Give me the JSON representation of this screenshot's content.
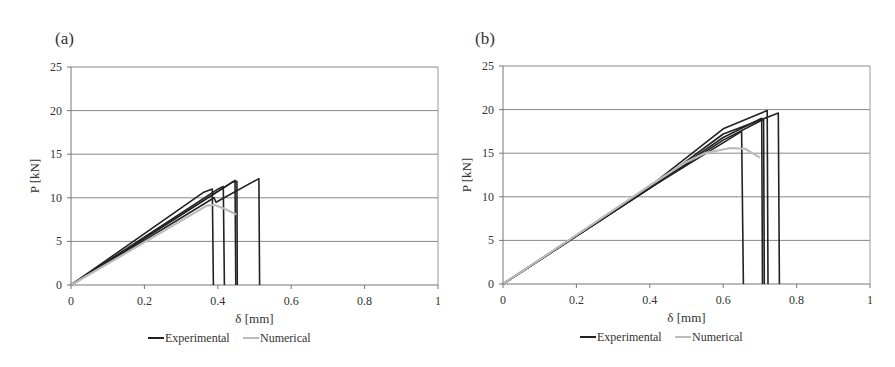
{
  "chart_data": [
    {
      "type": "line",
      "panel_label": "(a)",
      "xlabel": "δ [mm]",
      "ylabel": "P [kN]",
      "xlim": [
        0,
        1
      ],
      "ylim": [
        0,
        25
      ],
      "xticks": [
        "0",
        "0.2",
        "0.4",
        "0.6",
        "0.8",
        "1"
      ],
      "yticks": [
        "0",
        "5",
        "10",
        "15",
        "20",
        "25"
      ],
      "grid": true,
      "legend": [
        "Experimental",
        "Numerical"
      ],
      "legend_position": "bottom",
      "series": [
        {
          "name": "Experimental",
          "color": "#222222",
          "points": [
            [
              0,
              0
            ],
            [
              0.36,
              10.6
            ],
            [
              0.385,
              11.0
            ],
            [
              0.388,
              0
            ]
          ]
        },
        {
          "name": "Experimental",
          "color": "#222222",
          "points": [
            [
              0,
              0
            ],
            [
              0.4,
              11.0
            ],
            [
              0.415,
              11.3
            ],
            [
              0.418,
              0
            ]
          ]
        },
        {
          "name": "Experimental",
          "color": "#222222",
          "points": [
            [
              0,
              0
            ],
            [
              0.38,
              10.2
            ],
            [
              0.447,
              12.0
            ],
            [
              0.449,
              0
            ]
          ]
        },
        {
          "name": "Experimental",
          "color": "#222222",
          "points": [
            [
              0,
              0
            ],
            [
              0.39,
              10.0
            ],
            [
              0.395,
              9.5
            ],
            [
              0.512,
              12.2
            ],
            [
              0.514,
              0
            ]
          ]
        },
        {
          "name": "Experimental",
          "color": "#222222",
          "points": [
            [
              0,
              0
            ],
            [
              0.44,
              11.8
            ],
            [
              0.452,
              11.9
            ],
            [
              0.453,
              0
            ]
          ]
        },
        {
          "name": "Numerical",
          "color": "#bbbbbb",
          "points": [
            [
              0,
              0
            ],
            [
              0.2,
              4.9
            ],
            [
              0.37,
              9.1
            ],
            [
              0.39,
              9.2
            ],
            [
              0.42,
              8.7
            ],
            [
              0.45,
              8.1
            ]
          ]
        }
      ]
    },
    {
      "type": "line",
      "panel_label": "(b)",
      "xlabel": "δ [mm]",
      "ylabel": "P [kN]",
      "xlim": [
        0,
        1
      ],
      "ylim": [
        0,
        25
      ],
      "xticks": [
        "0",
        "0.2",
        "0.4",
        "0.6",
        "0.8",
        "1"
      ],
      "yticks": [
        "0",
        "5",
        "10",
        "15",
        "20",
        "25"
      ],
      "grid": true,
      "legend": [
        "Experimental",
        "Numerical"
      ],
      "legend_position": "bottom",
      "series": [
        {
          "name": "Experimental",
          "color": "#222222",
          "points": [
            [
              0,
              0
            ],
            [
              0.4,
              11.0
            ],
            [
              0.65,
              17.5
            ],
            [
              0.655,
              0
            ]
          ]
        },
        {
          "name": "Experimental",
          "color": "#222222",
          "points": [
            [
              0,
              0
            ],
            [
              0.4,
              11.0
            ],
            [
              0.6,
              16.8
            ],
            [
              0.705,
              19.0
            ],
            [
              0.707,
              0
            ]
          ]
        },
        {
          "name": "Experimental",
          "color": "#222222",
          "points": [
            [
              0,
              0
            ],
            [
              0.4,
              11.0
            ],
            [
              0.6,
              16.5
            ],
            [
              0.71,
              18.9
            ],
            [
              0.712,
              0
            ]
          ]
        },
        {
          "name": "Experimental",
          "color": "#222222",
          "points": [
            [
              0,
              0
            ],
            [
              0.4,
              11.2
            ],
            [
              0.6,
              17.8
            ],
            [
              0.72,
              19.9
            ],
            [
              0.722,
              0
            ]
          ]
        },
        {
          "name": "Experimental",
          "color": "#222222",
          "points": [
            [
              0,
              0
            ],
            [
              0.4,
              11.0
            ],
            [
              0.6,
              17.2
            ],
            [
              0.75,
              19.6
            ],
            [
              0.753,
              0
            ]
          ]
        },
        {
          "name": "Numerical",
          "color": "#bbbbbb",
          "points": [
            [
              0,
              0
            ],
            [
              0.2,
              5.6
            ],
            [
              0.4,
              11.3
            ],
            [
              0.5,
              14.0
            ],
            [
              0.55,
              15.0
            ],
            [
              0.62,
              15.6
            ],
            [
              0.66,
              15.5
            ],
            [
              0.7,
              14.5
            ]
          ]
        }
      ]
    }
  ]
}
